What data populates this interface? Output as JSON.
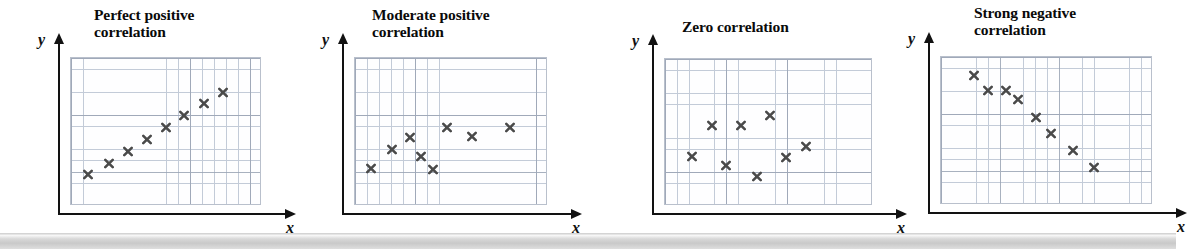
{
  "figure": {
    "width": 1176,
    "height": 249,
    "background_color": "#ffffff",
    "grid_line_color": "#c3cbd8",
    "grid_major_color": "#9aa4b4",
    "marker_color": "#4a4a4a",
    "axis_color": "#121212",
    "bottom_band_color": "#d2d2d2",
    "marker_glyph": "x"
  },
  "panels": [
    {
      "id": "perfect-positive",
      "title": "Perfect positive\ncorrelation",
      "title_lines": 2,
      "x_label": "x",
      "y_label": "y",
      "left": 18,
      "title_left": 76,
      "title_top": 6,
      "plot_left": 52,
      "plot_top": 57,
      "plot_width": 191,
      "plot_height": 148,
      "cols": 16,
      "rows": 13,
      "chart": {
        "type": "scatter",
        "title": "Perfect positive correlation",
        "xlabel": "x",
        "ylabel": "y",
        "xlim": [
          0,
          16
        ],
        "ylim": [
          0,
          13
        ],
        "grid": true,
        "points": [
          {
            "x": 1.4,
            "y": 2.6
          },
          {
            "x": 3.2,
            "y": 3.6
          },
          {
            "x": 4.8,
            "y": 4.6
          },
          {
            "x": 6.4,
            "y": 5.7
          },
          {
            "x": 8.0,
            "y": 6.8
          },
          {
            "x": 9.6,
            "y": 7.8
          },
          {
            "x": 11.3,
            "y": 8.9
          },
          {
            "x": 12.9,
            "y": 9.9
          }
        ]
      }
    },
    {
      "id": "moderate-positive",
      "title": "Moderate positive\ncorrelation",
      "title_lines": 2,
      "x_label": "x",
      "y_label": "y",
      "left": 308,
      "title_left": 64,
      "title_top": 6,
      "plot_left": 46,
      "plot_top": 57,
      "plot_width": 193,
      "plot_height": 148,
      "cols": 16,
      "rows": 13,
      "chart": {
        "type": "scatter",
        "title": "Moderate positive correlation",
        "xlabel": "x",
        "ylabel": "y",
        "xlim": [
          0,
          16
        ],
        "ylim": [
          0,
          13
        ],
        "grid": true,
        "points": [
          {
            "x": 1.3,
            "y": 3.1
          },
          {
            "x": 3.1,
            "y": 4.8
          },
          {
            "x": 4.6,
            "y": 5.9
          },
          {
            "x": 5.5,
            "y": 4.2
          },
          {
            "x": 6.5,
            "y": 3.0
          },
          {
            "x": 7.7,
            "y": 6.8
          },
          {
            "x": 9.8,
            "y": 6.0
          },
          {
            "x": 13.0,
            "y": 6.8
          }
        ]
      }
    },
    {
      "id": "zero",
      "title": "Zero correlation",
      "title_lines": 1,
      "x_label": "x",
      "y_label": "y",
      "left": 604,
      "title_left": 78,
      "title_top": 18,
      "plot_left": 60,
      "plot_top": 58,
      "plot_width": 208,
      "plot_height": 147,
      "cols": 17,
      "rows": 13,
      "chart": {
        "type": "scatter",
        "title": "Zero correlation",
        "xlabel": "x",
        "ylabel": "y",
        "xlim": [
          0,
          17
        ],
        "ylim": [
          0,
          13
        ],
        "grid": true,
        "points": [
          {
            "x": 2.2,
            "y": 4.2
          },
          {
            "x": 3.9,
            "y": 7.0
          },
          {
            "x": 5.0,
            "y": 3.4
          },
          {
            "x": 6.3,
            "y": 7.0
          },
          {
            "x": 7.6,
            "y": 2.4
          },
          {
            "x": 8.7,
            "y": 7.9
          },
          {
            "x": 10.0,
            "y": 4.1
          },
          {
            "x": 11.6,
            "y": 5.1
          }
        ]
      }
    },
    {
      "id": "strong-negative",
      "title": "Strong negative\ncorrelation",
      "title_lines": 2,
      "x_label": "x",
      "y_label": "y",
      "left": 900,
      "title_left": 74,
      "title_top": 4,
      "plot_left": 40,
      "plot_top": 56,
      "plot_width": 212,
      "plot_height": 148,
      "cols": 18,
      "rows": 13,
      "chart": {
        "type": "scatter",
        "title": "Strong negative correlation",
        "xlabel": "x",
        "ylabel": "y",
        "xlim": [
          0,
          18
        ],
        "ylim": [
          0,
          13
        ],
        "grid": true,
        "points": [
          {
            "x": 2.8,
            "y": 11.3
          },
          {
            "x": 4.0,
            "y": 10.0
          },
          {
            "x": 5.6,
            "y": 10.0
          },
          {
            "x": 6.6,
            "y": 9.2
          },
          {
            "x": 8.1,
            "y": 7.6
          },
          {
            "x": 9.4,
            "y": 6.1
          },
          {
            "x": 11.3,
            "y": 4.6
          },
          {
            "x": 13.1,
            "y": 3.1
          }
        ]
      }
    }
  ],
  "bottom_band": {
    "top": 236,
    "height": 13
  }
}
